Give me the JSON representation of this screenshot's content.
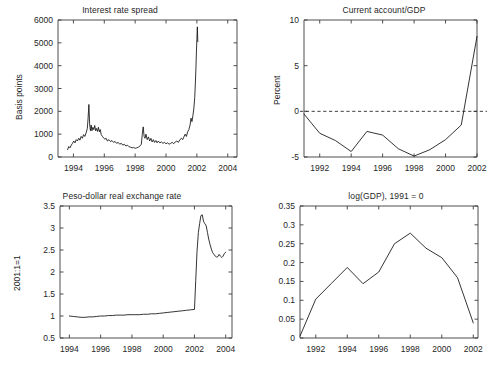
{
  "figure": {
    "background": "#ffffff",
    "line_color": "#111111",
    "axis_color": "#3b3b3b",
    "text_color": "#262626"
  },
  "chart_data": [
    {
      "type": "line",
      "panel": "top-left",
      "title": "Interest rate spread",
      "xlabel": "",
      "ylabel": "Basis points",
      "xlim": [
        1993.0,
        2004.6
      ],
      "ylim": [
        0,
        6000
      ],
      "xticks": [
        1994,
        1996,
        1998,
        2000,
        2002,
        2004
      ],
      "xticklabels": [
        "1994",
        "1996",
        "1998",
        "2000",
        "2002",
        "2004"
      ],
      "yticks": [
        0,
        1000,
        2000,
        3000,
        4000,
        5000,
        6000
      ],
      "yticklabels": [
        "0",
        "1000",
        "2000",
        "3000",
        "4000",
        "5000",
        "6000"
      ],
      "grid": false,
      "legend": "none",
      "x": [
        1993.62,
        1993.7,
        1993.78,
        1993.86,
        1993.94,
        1994.02,
        1994.1,
        1994.18,
        1994.26,
        1994.34,
        1994.42,
        1994.5,
        1994.58,
        1994.66,
        1994.74,
        1994.82,
        1994.9,
        1994.95,
        1995.0,
        1995.05,
        1995.1,
        1995.15,
        1995.2,
        1995.26,
        1995.32,
        1995.38,
        1995.44,
        1995.5,
        1995.56,
        1995.62,
        1995.68,
        1995.74,
        1995.8,
        1995.88,
        1995.96,
        1996.04,
        1996.12,
        1996.2,
        1996.3,
        1996.4,
        1996.5,
        1996.6,
        1996.7,
        1996.8,
        1996.9,
        1997.0,
        1997.1,
        1997.2,
        1997.3,
        1997.4,
        1997.5,
        1997.6,
        1997.7,
        1997.8,
        1997.9,
        1998.0,
        1998.1,
        1998.2,
        1998.3,
        1998.4,
        1998.46,
        1998.52,
        1998.58,
        1998.64,
        1998.7,
        1998.78,
        1998.86,
        1998.94,
        1999.02,
        1999.1,
        1999.18,
        1999.26,
        1999.34,
        1999.42,
        1999.5,
        1999.6,
        1999.7,
        1999.8,
        1999.9,
        2000.0,
        2000.1,
        2000.2,
        2000.3,
        2000.4,
        2000.5,
        2000.6,
        2000.7,
        2000.8,
        2000.9,
        2001.0,
        2001.08,
        2001.16,
        2001.24,
        2001.32,
        2001.4,
        2001.48,
        2001.56,
        2001.62,
        2001.68,
        2001.74,
        2001.8,
        2001.86,
        2001.9,
        2001.94,
        2001.97,
        2002.0,
        2002.03,
        2002.06
      ],
      "y": [
        320,
        460,
        400,
        520,
        600,
        700,
        620,
        760,
        700,
        820,
        740,
        900,
        820,
        980,
        900,
        1050,
        1250,
        1700,
        2300,
        1450,
        1150,
        1400,
        1150,
        1300,
        1200,
        1380,
        1150,
        1250,
        1120,
        1300,
        1100,
        1200,
        980,
        900,
        830,
        780,
        820,
        700,
        760,
        680,
        720,
        640,
        680,
        600,
        640,
        560,
        600,
        520,
        560,
        480,
        520,
        450,
        430,
        400,
        420,
        380,
        400,
        430,
        470,
        560,
        980,
        1320,
        900,
        820,
        1000,
        760,
        880,
        700,
        820,
        660,
        760,
        640,
        720,
        620,
        700,
        620,
        660,
        600,
        640,
        580,
        620,
        560,
        600,
        640,
        580,
        660,
        700,
        640,
        760,
        820,
        760,
        880,
        1000,
        900,
        1100,
        1200,
        1400,
        1700,
        1550,
        1800,
        2100,
        2600,
        3200,
        3900,
        4600,
        5150,
        5700,
        5050,
        5400
      ]
    },
    {
      "type": "line",
      "panel": "top-right",
      "title": "Current account/GDP",
      "xlabel": "",
      "ylabel": "Percent",
      "xlim": [
        1991.0,
        2002.0
      ],
      "ylim": [
        -5,
        10
      ],
      "xticks": [
        1992,
        1994,
        1996,
        1998,
        2000,
        2002
      ],
      "xticklabels": [
        "1992",
        "1994",
        "1996",
        "1998",
        "2000",
        "2002"
      ],
      "yticks": [
        -5,
        0,
        5,
        10
      ],
      "yticklabels": [
        "-5",
        "0",
        "5",
        "10"
      ],
      "grid": false,
      "legend": "none",
      "zero_reference_line": 0,
      "x": [
        1991,
        1992,
        1993,
        1994,
        1995,
        1996,
        1997,
        1998,
        1999,
        2000,
        2001,
        2002
      ],
      "y": [
        -0.3,
        -2.4,
        -3.2,
        -4.4,
        -2.2,
        -2.6,
        -4.1,
        -4.9,
        -4.2,
        -3.1,
        -1.5,
        8.2
      ]
    },
    {
      "type": "line",
      "panel": "bottom-left",
      "title": "Peso-dollar real exchange rate",
      "xlabel": "",
      "ylabel": "2001:1=1",
      "xlim": [
        1993.4,
        2004.4
      ],
      "ylim": [
        0.5,
        3.5
      ],
      "xticks": [
        1994,
        1996,
        1998,
        2000,
        2002,
        2004
      ],
      "xticklabels": [
        "1994",
        "1996",
        "1998",
        "2000",
        "2002",
        "2004"
      ],
      "yticks": [
        0.5,
        1,
        1.5,
        2,
        2.5,
        3,
        3.5
      ],
      "yticklabels": [
        "0.5",
        "1",
        "1.5",
        "2",
        "2.5",
        "3",
        "3.5"
      ],
      "grid": false,
      "legend": "none",
      "x": [
        1994.0,
        1994.25,
        1994.5,
        1994.75,
        1995.0,
        1995.25,
        1995.5,
        1995.75,
        1996.0,
        1996.25,
        1996.5,
        1996.75,
        1997.0,
        1997.25,
        1997.5,
        1997.75,
        1998.0,
        1998.25,
        1998.5,
        1998.75,
        1999.0,
        1999.25,
        1999.5,
        1999.75,
        2000.0,
        2000.25,
        2000.5,
        2000.75,
        2001.0,
        2001.25,
        2001.5,
        2001.75,
        2002.0,
        2002.08,
        2002.16,
        2002.25,
        2002.33,
        2002.41,
        2002.5,
        2002.58,
        2002.66,
        2002.75,
        2002.83,
        2002.91,
        2003.0,
        2003.08,
        2003.16,
        2003.25,
        2003.33,
        2003.41,
        2003.5,
        2003.58,
        2003.66,
        2003.75,
        2003.83,
        2003.91,
        2004.0
      ],
      "y": [
        1.0,
        0.99,
        0.98,
        0.97,
        0.97,
        0.98,
        0.98,
        0.99,
        1.0,
        1.0,
        1.01,
        1.01,
        1.02,
        1.02,
        1.02,
        1.03,
        1.03,
        1.03,
        1.03,
        1.04,
        1.04,
        1.05,
        1.05,
        1.06,
        1.07,
        1.08,
        1.09,
        1.1,
        1.11,
        1.12,
        1.13,
        1.14,
        1.15,
        1.8,
        2.45,
        2.9,
        3.1,
        3.28,
        3.3,
        3.15,
        3.1,
        3.05,
        2.9,
        2.75,
        2.62,
        2.52,
        2.44,
        2.4,
        2.36,
        2.34,
        2.35,
        2.4,
        2.36,
        2.33,
        2.36,
        2.42,
        2.45
      ]
    },
    {
      "type": "line",
      "panel": "bottom-right",
      "title": "log(GDP), 1991 = 0",
      "xlabel": "",
      "ylabel": "",
      "xlim": [
        1991.0,
        2002.3
      ],
      "ylim": [
        0,
        0.35
      ],
      "xticks": [
        1992,
        1994,
        1996,
        1998,
        2000,
        2002
      ],
      "xticklabels": [
        "1992",
        "1994",
        "1996",
        "1998",
        "2000",
        "2002"
      ],
      "yticks": [
        0,
        0.05,
        0.1,
        0.15,
        0.2,
        0.25,
        0.3,
        0.35
      ],
      "yticklabels": [
        "0",
        "0.05",
        "0.1",
        "0.15",
        "0.2",
        "0.25",
        "0.3",
        "0.35"
      ],
      "grid": false,
      "legend": "none",
      "x": [
        1991,
        1992,
        1993,
        1994,
        1995,
        1996,
        1997,
        1998,
        1999,
        2000,
        2001,
        2002
      ],
      "y": [
        0.005,
        0.103,
        0.145,
        0.187,
        0.144,
        0.175,
        0.25,
        0.278,
        0.238,
        0.213,
        0.16,
        0.04
      ]
    }
  ]
}
